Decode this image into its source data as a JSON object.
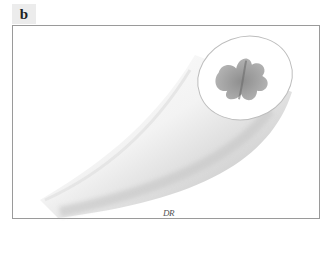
{
  "figure": {
    "panel_label": "b",
    "signature": "DR",
    "colors": {
      "frame_border": "#9a9a9a",
      "label_bg": "#ececec",
      "shaft_light": "#ffffff",
      "shaft_shadow": "#c8c8c8",
      "medulla": "#8f8f8f"
    }
  }
}
